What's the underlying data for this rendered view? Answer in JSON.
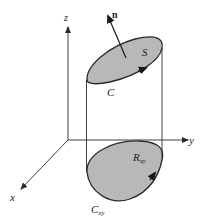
{
  "diagram": {
    "axes": {
      "x_label": "x",
      "y_label": "y",
      "z_label": "z"
    },
    "surface": {
      "label": "S",
      "boundary_label": "C",
      "normal_label": "n"
    },
    "projection": {
      "region_label_main": "R",
      "region_label_sub": "xy",
      "boundary_label_main": "C",
      "boundary_label_sub": "xy"
    },
    "colors": {
      "fill": "#b8b8b8",
      "stroke": "#2a2a2a",
      "background": "#ffffff"
    }
  }
}
